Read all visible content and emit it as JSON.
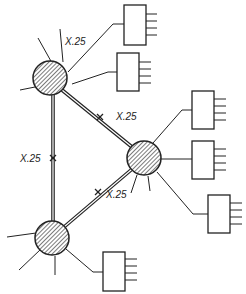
{
  "diagram": {
    "type": "network",
    "colors": {
      "line": "#222222",
      "hatch": "#444444",
      "background": "#ffffff"
    },
    "nodes": [
      {
        "id": "A",
        "cx": 50,
        "cy": 78,
        "r": 17
      },
      {
        "id": "B",
        "cx": 144,
        "cy": 158,
        "r": 17
      },
      {
        "id": "C",
        "cx": 52,
        "cy": 238,
        "r": 17
      }
    ],
    "links": [
      {
        "from": "A",
        "to": "B",
        "label": "X.25"
      },
      {
        "from": "A",
        "to": "C",
        "label": "X.25"
      },
      {
        "from": "C",
        "to": "B",
        "label": "X.25"
      }
    ],
    "labels": {
      "top": "X.25",
      "ab": "X.25",
      "ac": "X.25",
      "cb": "X.25"
    },
    "terminals": [
      {
        "id": "T1",
        "attached_to": "A",
        "ports": 4
      },
      {
        "id": "T2",
        "attached_to": "A",
        "ports": 4
      },
      {
        "id": "T3",
        "attached_to": "B",
        "ports": 4
      },
      {
        "id": "T4",
        "attached_to": "B",
        "ports": 4
      },
      {
        "id": "T5",
        "attached_to": "B",
        "ports": 4
      },
      {
        "id": "T6",
        "attached_to": "C",
        "ports": 4
      }
    ]
  }
}
